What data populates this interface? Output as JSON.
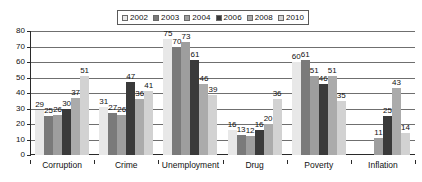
{
  "legend": {
    "position": "top",
    "items": [
      {
        "label": "2002",
        "color": "#e8e8e8",
        "icon": "legend-swatch-icon"
      },
      {
        "label": "2003",
        "color": "#7a7a7a",
        "icon": "legend-swatch-icon"
      },
      {
        "label": "2004",
        "color": "#9e9e9e",
        "icon": "legend-swatch-icon"
      },
      {
        "label": "2006",
        "color": "#3a3a3a",
        "icon": "legend-swatch-icon"
      },
      {
        "label": "2008",
        "color": "#ababab",
        "icon": "legend-swatch-icon"
      },
      {
        "label": "2010",
        "color": "#d2d2d2",
        "icon": "legend-swatch-icon"
      }
    ]
  },
  "axis": {
    "y_ticks": [
      "0",
      "10",
      "20",
      "30",
      "40",
      "50",
      "60",
      "70",
      "80"
    ]
  },
  "chart_data": {
    "type": "bar",
    "title": "",
    "subtitle": "",
    "xlabel": "",
    "ylabel": "",
    "ylim": [
      0,
      80
    ],
    "ytick_step": 10,
    "grid": true,
    "legend_position": "top",
    "categories": [
      "Corruption",
      "Crime",
      "Unemployment",
      "Drug",
      "Poverty",
      "Inflation"
    ],
    "series": [
      {
        "name": "2002",
        "color": "#e8e8e8",
        "values": [
          29,
          31,
          75,
          16,
          60,
          null
        ]
      },
      {
        "name": "2003",
        "color": "#7a7a7a",
        "values": [
          25,
          27,
          70,
          13,
          61,
          null
        ]
      },
      {
        "name": "2004",
        "color": "#9e9e9e",
        "values": [
          26,
          26,
          73,
          12,
          51,
          11
        ]
      },
      {
        "name": "2006",
        "color": "#3a3a3a",
        "values": [
          30,
          47,
          61,
          16,
          46,
          25
        ]
      },
      {
        "name": "2008",
        "color": "#ababab",
        "values": [
          37,
          36,
          46,
          20,
          51,
          43
        ]
      },
      {
        "name": "2010",
        "color": "#d2d2d2",
        "values": [
          51,
          41,
          39,
          36,
          35,
          14
        ]
      }
    ]
  }
}
